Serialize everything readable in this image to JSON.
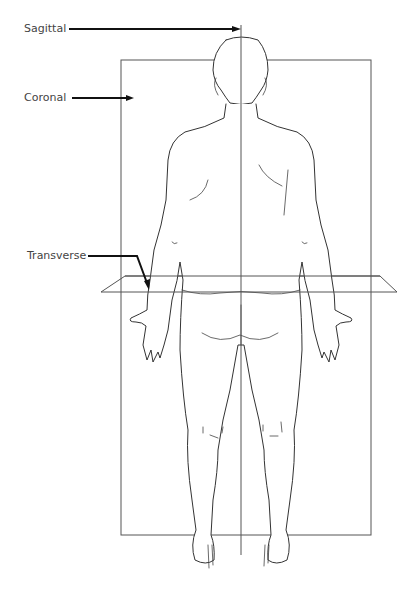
{
  "diagram": {
    "labels": {
      "sagittal": "Sagittal",
      "coronal": "Coronal",
      "transverse": "Transverse"
    },
    "planes": [
      {
        "name": "Sagittal",
        "shape": "vertical line",
        "x": 241,
        "y_top": 25,
        "y_bottom": 555
      },
      {
        "name": "Coronal",
        "shape": "rectangle",
        "x": 121,
        "y": 60,
        "width": 250,
        "height": 475
      },
      {
        "name": "Transverse",
        "shape": "parallelogram",
        "points": [
          [
            101,
            292
          ],
          [
            125,
            276
          ],
          [
            380,
            276
          ],
          [
            397,
            292
          ]
        ]
      }
    ],
    "colors": {
      "line": "#333333",
      "label": "#444444",
      "arrow": "#111111"
    }
  }
}
